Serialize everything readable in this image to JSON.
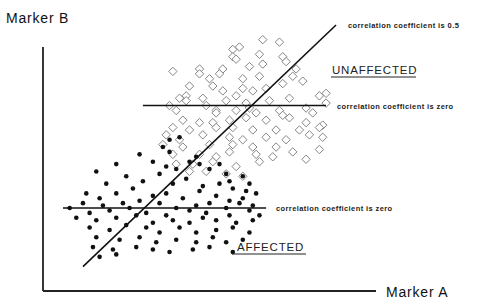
{
  "chart_data": {
    "type": "scatter",
    "title": "",
    "xlabel": "Marker A",
    "ylabel": "Marker B",
    "xlim": [
      0,
      100
    ],
    "ylim": [
      0,
      100
    ],
    "grid": false,
    "legend": "none",
    "annotations": [
      {
        "id": "corr-05",
        "text": "correlation coefficient is 0.5",
        "type": "regression-line"
      },
      {
        "id": "corr-zero-unaffected",
        "text": "correlation coefficient is zero",
        "type": "horizontal-line"
      },
      {
        "id": "corr-zero-affected",
        "text": "correlation coefficient is zero",
        "type": "horizontal-line"
      }
    ],
    "group_labels": {
      "unaffected": "UNAFFECTED",
      "affected": "AFFECTED"
    },
    "lines": {
      "regression": {
        "x": [
          12,
          88
        ],
        "y": [
          10,
          109
        ]
      },
      "unaffected_zero": {
        "x": [
          30,
          85
        ],
        "y": 76
      },
      "affected_zero": {
        "x": [
          6,
          67
        ],
        "y": 34
      }
    },
    "series": [
      {
        "name": "UNAFFECTED",
        "marker": "open-diamond",
        "points": [
          [
            59,
            100
          ],
          [
            66,
            103
          ],
          [
            71,
            102
          ],
          [
            57,
            99
          ],
          [
            57,
            96
          ],
          [
            58,
            95
          ],
          [
            65,
            97
          ],
          [
            72,
            96
          ],
          [
            62,
            92
          ],
          [
            66,
            93
          ],
          [
            73,
            94
          ],
          [
            39,
            90
          ],
          [
            47,
            91
          ],
          [
            47,
            89
          ],
          [
            54,
            91
          ],
          [
            53,
            89
          ],
          [
            50,
            87
          ],
          [
            60,
            87
          ],
          [
            65,
            88
          ],
          [
            76,
            91
          ],
          [
            75,
            88
          ],
          [
            78,
            86
          ],
          [
            44,
            84
          ],
          [
            51,
            84
          ],
          [
            54,
            82
          ],
          [
            58,
            80
          ],
          [
            60,
            83
          ],
          [
            63,
            82
          ],
          [
            67,
            83
          ],
          [
            72,
            85
          ],
          [
            74,
            79
          ],
          [
            85,
            81
          ],
          [
            41,
            79
          ],
          [
            43,
            80
          ],
          [
            48,
            79
          ],
          [
            55,
            78
          ],
          [
            61,
            77
          ],
          [
            68,
            78
          ],
          [
            83,
            80
          ],
          [
            38,
            76
          ],
          [
            43,
            78
          ],
          [
            49,
            76
          ],
          [
            52,
            74
          ],
          [
            62,
            75
          ],
          [
            71,
            74
          ],
          [
            79,
            75
          ],
          [
            85,
            77
          ],
          [
            40,
            74
          ],
          [
            52,
            73
          ],
          [
            58,
            74
          ],
          [
            64,
            73
          ],
          [
            72,
            72
          ],
          [
            81,
            73
          ],
          [
            42,
            70
          ],
          [
            47,
            69
          ],
          [
            51,
            69
          ],
          [
            56,
            70
          ],
          [
            61,
            71
          ],
          [
            67,
            70
          ],
          [
            74,
            71
          ],
          [
            79,
            69
          ],
          [
            84,
            68
          ],
          [
            39,
            67
          ],
          [
            44,
            66
          ],
          [
            52,
            67
          ],
          [
            57,
            67
          ],
          [
            63,
            66
          ],
          [
            70,
            66
          ],
          [
            77,
            66
          ],
          [
            83,
            67
          ],
          [
            37,
            64
          ],
          [
            41,
            62
          ],
          [
            48,
            64
          ],
          [
            56,
            63
          ],
          [
            60,
            62
          ],
          [
            67,
            63
          ],
          [
            73,
            62
          ],
          [
            80,
            64
          ],
          [
            84,
            63
          ],
          [
            36,
            60
          ],
          [
            42,
            59
          ],
          [
            50,
            60
          ],
          [
            57,
            60
          ],
          [
            63,
            59
          ],
          [
            70,
            59
          ],
          [
            75,
            57
          ],
          [
            83,
            58
          ],
          [
            39,
            56
          ],
          [
            47,
            56
          ],
          [
            52,
            55
          ],
          [
            56,
            57
          ],
          [
            64,
            56
          ],
          [
            69,
            55
          ],
          [
            79,
            54
          ],
          [
            40,
            52
          ],
          [
            45,
            52
          ],
          [
            51,
            53
          ],
          [
            58,
            51
          ],
          [
            65,
            53
          ],
          [
            44,
            49
          ],
          [
            49,
            49
          ],
          [
            55,
            48
          ],
          [
            60,
            47
          ]
        ]
      },
      {
        "name": "AFFECTED",
        "marker": "filled-dot",
        "points": [
          [
            38,
            62
          ],
          [
            41,
            63
          ],
          [
            36,
            59
          ],
          [
            38,
            57
          ],
          [
            46,
            55
          ],
          [
            16,
            49
          ],
          [
            22,
            52
          ],
          [
            29,
            56
          ],
          [
            33,
            53
          ],
          [
            37,
            51
          ],
          [
            40,
            50
          ],
          [
            44,
            53
          ],
          [
            47,
            52
          ],
          [
            50,
            50
          ],
          [
            53,
            52
          ],
          [
            55,
            48
          ],
          [
            56,
            45
          ],
          [
            60,
            47
          ],
          [
            62,
            44
          ],
          [
            19,
            44
          ],
          [
            25,
            47
          ],
          [
            30,
            45
          ],
          [
            35,
            48
          ],
          [
            39,
            44
          ],
          [
            43,
            46
          ],
          [
            48,
            43
          ],
          [
            53,
            44
          ],
          [
            57,
            42
          ],
          [
            61,
            41
          ],
          [
            13,
            40
          ],
          [
            17,
            38
          ],
          [
            22,
            40
          ],
          [
            27,
            42
          ],
          [
            33,
            39
          ],
          [
            37,
            40
          ],
          [
            42,
            38
          ],
          [
            47,
            41
          ],
          [
            52,
            39
          ],
          [
            56,
            37
          ],
          [
            60,
            38
          ],
          [
            64,
            40
          ],
          [
            12,
            36
          ],
          [
            18,
            35
          ],
          [
            24,
            36
          ],
          [
            29,
            37
          ],
          [
            35,
            36
          ],
          [
            40,
            34
          ],
          [
            46,
            35
          ],
          [
            50,
            36
          ],
          [
            55,
            34
          ],
          [
            59,
            36
          ],
          [
            63,
            35
          ],
          [
            8,
            34
          ],
          [
            14,
            32
          ],
          [
            20,
            33
          ],
          [
            26,
            34
          ],
          [
            31,
            32
          ],
          [
            37,
            31
          ],
          [
            44,
            33
          ],
          [
            49,
            32
          ],
          [
            56,
            31
          ],
          [
            62,
            33
          ],
          [
            10,
            30
          ],
          [
            16,
            29
          ],
          [
            22,
            30
          ],
          [
            28,
            31
          ],
          [
            33,
            28
          ],
          [
            39,
            29
          ],
          [
            44,
            28
          ],
          [
            48,
            30
          ],
          [
            52,
            29
          ],
          [
            58,
            28
          ],
          [
            63,
            29
          ],
          [
            65,
            31
          ],
          [
            14,
            26
          ],
          [
            20,
            25
          ],
          [
            25,
            27
          ],
          [
            31,
            26
          ],
          [
            35,
            24
          ],
          [
            41,
            26
          ],
          [
            46,
            24
          ],
          [
            52,
            25
          ],
          [
            57,
            26
          ],
          [
            62,
            24
          ],
          [
            16,
            22
          ],
          [
            23,
            21
          ],
          [
            29,
            22
          ],
          [
            34,
            20
          ],
          [
            40,
            21
          ],
          [
            46,
            20
          ],
          [
            51,
            22
          ],
          [
            55,
            20
          ],
          [
            60,
            21
          ],
          [
            15,
            18
          ],
          [
            21,
            17
          ],
          [
            28,
            18
          ],
          [
            33,
            17
          ],
          [
            38,
            16
          ],
          [
            45,
            17
          ],
          [
            50,
            18
          ],
          [
            57,
            16
          ],
          [
            17,
            14
          ],
          [
            22,
            15
          ]
        ]
      }
    ]
  },
  "labels": {
    "y_axis": "Marker B",
    "x_axis": "Marker A",
    "corr_05": "correlation coefficient is 0.5",
    "corr_zero_upper": "correlation coefficient is zero",
    "corr_zero_lower": "correlation coefficient is zero",
    "unaffected": "UNAFFECTED",
    "affected": "AFFECTED"
  }
}
